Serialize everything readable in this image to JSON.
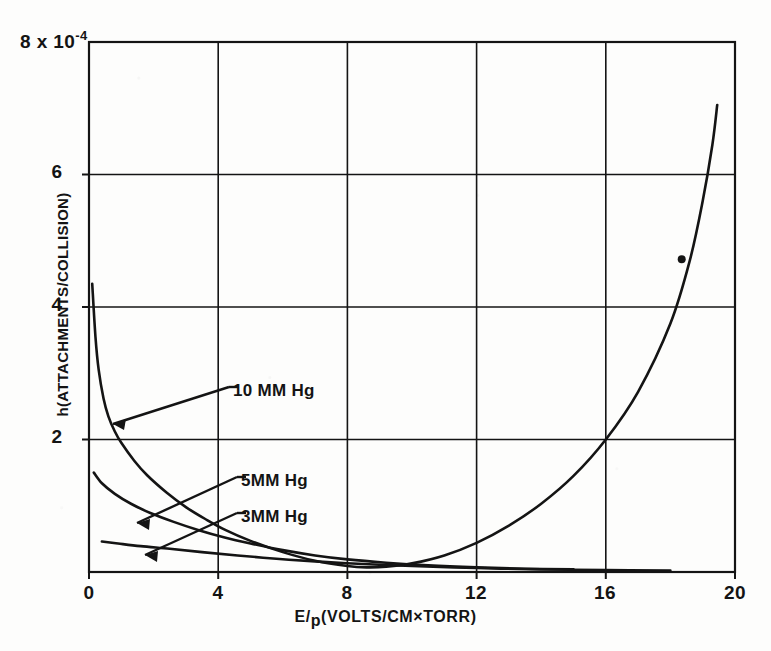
{
  "figure": {
    "background_color": "#fdfdfc",
    "ink_color": "#141414"
  },
  "axes": {
    "y_exponent_label": "8 x 10",
    "y_exponent_superscript": "-4",
    "y_title": "h(ATTACHMENTS/COLLISION)",
    "y_ticks": [
      "6",
      "4",
      "2"
    ],
    "x_title_main": "E/",
    "x_title_sub": "p",
    "x_title_rest": "(VOLTS/CM×TORR)",
    "x_ticks": [
      "0",
      "4",
      "8",
      "12",
      "16",
      "20"
    ]
  },
  "annotations": [
    {
      "label": "10 MM Hg"
    },
    {
      "label": "5MM Hg"
    },
    {
      "label": "3MM Hg"
    }
  ],
  "chart_data": {
    "type": "line",
    "title": "",
    "xlabel": "E/p(VOLTS/CM×TORR)",
    "ylabel": "h(ATTACHMENTS/COLLISION)",
    "y_scale_factor": "1e-4",
    "xlim": [
      0,
      20
    ],
    "ylim": [
      0,
      8
    ],
    "x_ticks": [
      0,
      4,
      8,
      12,
      16,
      20
    ],
    "y_ticks": [
      0,
      2,
      4,
      6,
      8
    ],
    "grid": true,
    "legend": "inline-annotations-with-leader-arrows",
    "series": [
      {
        "name": "10 MM Hg",
        "annotation_label": "10 MM Hg",
        "comment": "steeply decaying branch from high h at low E/p, passing through a broad minimum near E/p = 8.5, then rising sharply toward E/p = 19",
        "points": [
          [
            0.1,
            4.35
          ],
          [
            0.2,
            3.55
          ],
          [
            0.3,
            3.05
          ],
          [
            0.45,
            2.62
          ],
          [
            0.6,
            2.35
          ],
          [
            0.8,
            2.12
          ],
          [
            1.0,
            1.95
          ],
          [
            1.4,
            1.68
          ],
          [
            1.8,
            1.46
          ],
          [
            2.4,
            1.2
          ],
          [
            3.0,
            0.98
          ],
          [
            3.6,
            0.8
          ],
          [
            4.2,
            0.64
          ],
          [
            5.0,
            0.47
          ],
          [
            6.0,
            0.3
          ],
          [
            7.0,
            0.17
          ],
          [
            8.0,
            0.09
          ],
          [
            8.6,
            0.07
          ],
          [
            9.2,
            0.08
          ],
          [
            10.0,
            0.13
          ],
          [
            11.0,
            0.25
          ],
          [
            12.0,
            0.44
          ],
          [
            13.0,
            0.7
          ],
          [
            14.0,
            1.03
          ],
          [
            15.0,
            1.45
          ],
          [
            16.0,
            2.0
          ],
          [
            17.0,
            2.72
          ],
          [
            18.0,
            3.75
          ],
          [
            18.6,
            4.7
          ],
          [
            19.0,
            5.6
          ],
          [
            19.3,
            6.45
          ],
          [
            19.45,
            7.05
          ]
        ]
      },
      {
        "name": "5MM Hg",
        "annotation_label": "5MM Hg",
        "comment": "decaying curve starting near h = 1.5 at low E/p, merging toward the axis beyond E/p = 10",
        "points": [
          [
            0.15,
            1.5
          ],
          [
            0.4,
            1.34
          ],
          [
            0.8,
            1.18
          ],
          [
            1.3,
            1.03
          ],
          [
            1.9,
            0.89
          ],
          [
            2.6,
            0.76
          ],
          [
            3.4,
            0.63
          ],
          [
            4.2,
            0.52
          ],
          [
            5.0,
            0.43
          ],
          [
            6.0,
            0.33
          ],
          [
            7.0,
            0.25
          ],
          [
            8.0,
            0.19
          ],
          [
            9.2,
            0.14
          ],
          [
            10.5,
            0.1
          ],
          [
            12.0,
            0.07
          ],
          [
            13.5,
            0.05
          ],
          [
            15.0,
            0.04
          ]
        ]
      },
      {
        "name": "3MM Hg",
        "annotation_label": "3MM Hg",
        "comment": "lowest, nearly flat decaying curve starting near h = 0.45",
        "points": [
          [
            0.4,
            0.46
          ],
          [
            0.9,
            0.43
          ],
          [
            1.6,
            0.39
          ],
          [
            2.5,
            0.35
          ],
          [
            3.5,
            0.3
          ],
          [
            4.6,
            0.25
          ],
          [
            5.8,
            0.2
          ],
          [
            7.0,
            0.16
          ],
          [
            8.5,
            0.12
          ],
          [
            10.0,
            0.09
          ],
          [
            12.0,
            0.06
          ],
          [
            14.0,
            0.04
          ],
          [
            16.0,
            0.03
          ],
          [
            18.0,
            0.02
          ]
        ]
      }
    ],
    "data_points": [
      {
        "x": 18.35,
        "y": 4.72,
        "marker": "filled-circle"
      }
    ]
  }
}
